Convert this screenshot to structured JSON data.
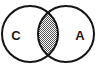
{
  "figure": {
    "name": "venn-diagram",
    "type": "two-set-venn",
    "background_color": "#ffffff",
    "outline_color": "#151515",
    "intersection_fill_color": "#9a9a9a",
    "intersection_pattern": "checkerboard-hatch"
  },
  "sets": [
    {
      "id": "set-c",
      "label": "C",
      "position": "left",
      "center_x": 30,
      "center_y": 34,
      "radius": 28,
      "label_x": 16,
      "label_y": 35
    },
    {
      "id": "set-a",
      "label": "A",
      "position": "right",
      "center_x": 66,
      "center_y": 34,
      "radius": 28,
      "label_x": 80,
      "label_y": 35
    }
  ],
  "intersection": {
    "id": "intersection-region",
    "label": "",
    "shaded": true
  }
}
